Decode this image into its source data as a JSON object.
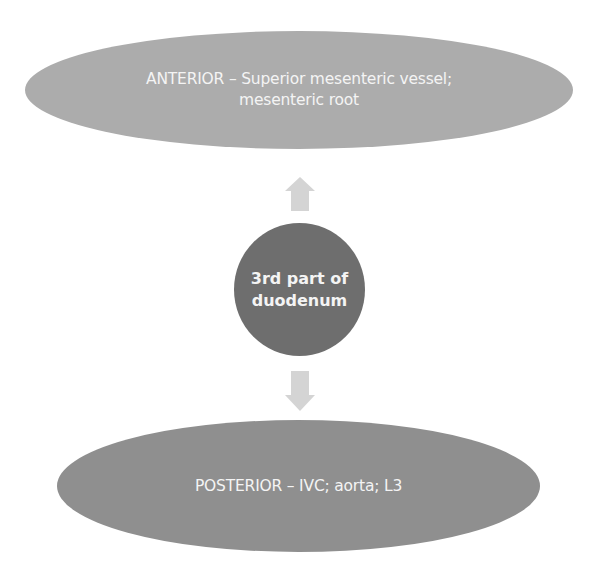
{
  "diagram": {
    "anterior": {
      "text": "ANTERIOR – Superior mesenteric vessel; mesenteric root",
      "color": "#acacac"
    },
    "center": {
      "line1": "3rd part of",
      "line2": "duodenum",
      "color": "#6e6e6e"
    },
    "posterior": {
      "text": "POSTERIOR – IVC; aorta; L3",
      "color": "#8f8f8f"
    },
    "arrows": {
      "up": "arrow-up-icon",
      "down": "arrow-down-icon",
      "color": "#d4d4d4"
    }
  }
}
